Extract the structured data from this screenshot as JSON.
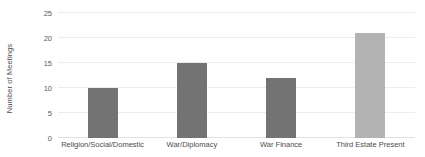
{
  "chart_data": {
    "type": "bar",
    "title": "",
    "subtitle": "",
    "xlabel": "",
    "ylabel": "Number of Meetings",
    "categories": [
      "Religion/Social/Domestic",
      "War/Diplomacy",
      "War Finance",
      "Third Estate Present"
    ],
    "values": [
      10,
      15,
      12,
      21
    ],
    "ylim": [
      0,
      25
    ],
    "yticks": [
      0,
      5,
      10,
      15,
      20,
      25
    ],
    "ytick_labels": [
      "0",
      "5",
      "10",
      "15",
      "20",
      "25"
    ],
    "bar_colors": [
      "#737373",
      "#737373",
      "#737373",
      "#b3b3b3"
    ],
    "grid": "horizontal",
    "gridline_color": "#ededed",
    "legend": "none",
    "background": "#ffffff",
    "annotations": []
  },
  "axes": {
    "y_title": "Number of Meetings",
    "y_tick_color": "#595959",
    "x_tick_color": "#4d4d4d"
  }
}
